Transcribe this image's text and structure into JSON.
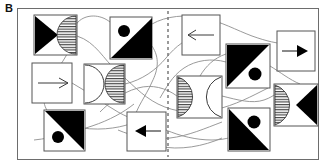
{
  "figure": {
    "panel_label": "B",
    "type": "schematic-diagram",
    "canvas": {
      "width": 324,
      "height": 167,
      "background": "#ffffff"
    },
    "frame": {
      "x": 17,
      "y": 8,
      "width": 302,
      "height": 152,
      "stroke": "#6d6d6d",
      "stroke_width": 1
    }
  },
  "style": {
    "fill_black": "#000000",
    "tile_stroke": "#555555",
    "connector_stroke": "#8a8a8a",
    "hatch_stroke": "#333333",
    "divider_stroke": "#707070",
    "background": "#ffffff"
  },
  "divider": {
    "name": "vertical-dashed-divider",
    "orientation": "vertical",
    "x": 168,
    "y_start": 11,
    "y_end": 157,
    "dash": "3 3",
    "color": "#707070"
  },
  "tiles": [
    {
      "id": "t1",
      "name": "tile-triangle-right-hatched-halfdisc",
      "x": 34,
      "y": 15,
      "w": 43,
      "h": 40,
      "contents": [
        "black-triangle-pointing-right",
        "hatched-half-disc-bulge-left"
      ]
    },
    {
      "id": "t2",
      "name": "tile-circle-topleft-black-lower-triangle",
      "x": 110,
      "y": 17,
      "w": 42,
      "h": 42,
      "contents": [
        "black-circle-top-left",
        "black-triangle-lower-right"
      ]
    },
    {
      "id": "t3",
      "name": "tile-arrow-left",
      "x": 182,
      "y": 15,
      "w": 38,
      "h": 40,
      "contents": [
        "arrow-pointing-left"
      ]
    },
    {
      "id": "t4",
      "name": "tile-arrow-right",
      "x": 277,
      "y": 31,
      "w": 38,
      "h": 40,
      "contents": [
        "arrow-pointing-right"
      ]
    },
    {
      "id": "t5",
      "name": "tile-arrow-right-thin",
      "x": 32,
      "y": 63,
      "w": 40,
      "h": 40,
      "contents": [
        "arrow-pointing-right"
      ]
    },
    {
      "id": "t6",
      "name": "tile-open-halfdisc-hatched-halfdisc",
      "x": 84,
      "y": 64,
      "w": 41,
      "h": 40,
      "contents": [
        "open-half-disc-bulge-right",
        "hatched-half-disc-bulge-left"
      ]
    },
    {
      "id": "t7",
      "name": "tile-hatched-halfdisc-open-halfdisc",
      "x": 177,
      "y": 76,
      "w": 45,
      "h": 42,
      "contents": [
        "hatched-half-disc-bulge-right",
        "open-half-disc-bulge-left"
      ]
    },
    {
      "id": "t8",
      "name": "tile-black-upper-triangle-circle-lowerright",
      "x": 226,
      "y": 44,
      "w": 44,
      "h": 44,
      "contents": [
        "black-triangle-upper-left",
        "black-circle-lower-right"
      ]
    },
    {
      "id": "t9",
      "name": "tile-hatched-halfdisc-triangle-left",
      "x": 274,
      "y": 84,
      "w": 44,
      "h": 42,
      "contents": [
        "hatched-half-disc-bulge-right",
        "black-triangle-pointing-left"
      ]
    },
    {
      "id": "t10",
      "name": "tile-black-upper-triangle-circle-lowerleft",
      "x": 44,
      "y": 110,
      "w": 41,
      "h": 41,
      "contents": [
        "black-triangle-upper-right",
        "black-circle-lower-left"
      ]
    },
    {
      "id": "t11",
      "name": "tile-arrow-left-thick",
      "x": 127,
      "y": 112,
      "w": 39,
      "h": 39,
      "contents": [
        "arrow-pointing-left"
      ]
    },
    {
      "id": "t12",
      "name": "tile-black-lower-triangle-circle-topright",
      "x": 228,
      "y": 108,
      "w": 42,
      "h": 43,
      "contents": [
        "black-triangle-lower-left",
        "black-circle-top-right"
      ]
    }
  ],
  "connectors": {
    "name": "curved-connector-lines",
    "count": 9,
    "stroke": "#8a8a8a",
    "stroke_width": 0.9,
    "style": "thin smooth curves crossing the panel and the dashed divider"
  }
}
